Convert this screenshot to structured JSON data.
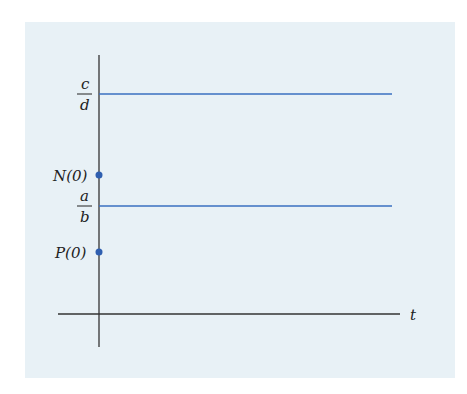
{
  "diagram": {
    "background_color": "#e8f1f6",
    "line_color": "#3a6fc0",
    "axis_color": "#333333",
    "x_axis_label": "t",
    "levels": [
      {
        "numerator": "c",
        "denominator": "d",
        "description": "upper equilibrium level c/d"
      },
      {
        "numerator": "a",
        "denominator": "b",
        "description": "lower equilibrium level a/b"
      }
    ],
    "points": [
      {
        "label": "N(0)",
        "description": "initial value N(0) on vertical axis"
      },
      {
        "label": "P(0)",
        "description": "initial value P(0) on vertical axis"
      }
    ]
  }
}
